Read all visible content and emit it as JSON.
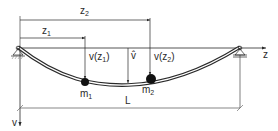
{
  "diagram": {
    "labels": {
      "z1": {
        "main": "z",
        "sub": "1"
      },
      "z2": {
        "main": "z",
        "sub": "2"
      },
      "v_z1": {
        "pre": "v(z",
        "sub": "1",
        "post": ")"
      },
      "v_z2": {
        "pre": "v(z",
        "sub": "2",
        "post": ")"
      },
      "v_hat": "v̂",
      "m1": {
        "main": "m",
        "sub": "1"
      },
      "m2": {
        "main": "m",
        "sub": "2"
      },
      "z_axis": "z",
      "v_axis": "v",
      "length": "L"
    },
    "colors": {
      "line": "#2a2a2a",
      "background": "#ffffff"
    }
  }
}
